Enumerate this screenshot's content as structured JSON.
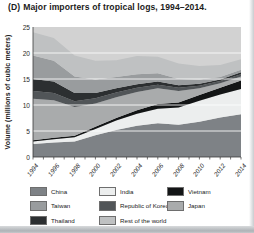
{
  "title": {
    "prefix": "(D)",
    "text": "Major importers of tropical logs, 1994–2014."
  },
  "chart_data": {
    "type": "area",
    "stacked": true,
    "xlabel": "",
    "ylabel": "Volume (millions of cubic meters)",
    "ylim": [
      0,
      25
    ],
    "yticks": [
      0,
      5,
      10,
      15,
      20,
      25
    ],
    "grid": true,
    "grid_color": "#ffffff",
    "plot_bg_color": "#d2d2d2",
    "axis_color": "#3a3a3a",
    "legend_position": "bottom",
    "x": [
      1994,
      1996,
      1998,
      2000,
      2002,
      2004,
      2006,
      2008,
      2010,
      2012,
      2014
    ],
    "x_tick_labels": [
      "1994",
      "1996",
      "1998",
      "2000",
      "2002",
      "2004",
      "2006",
      "2008",
      "2010",
      "2012",
      "2014"
    ],
    "series": [
      {
        "name": "China",
        "color": "#7e8286",
        "values": [
          2.5,
          2.8,
          3.0,
          4.2,
          5.2,
          6.0,
          6.5,
          6.2,
          6.8,
          7.6,
          8.2
        ]
      },
      {
        "name": "India",
        "color": "#eceeee",
        "values": [
          0.5,
          0.6,
          0.8,
          1.2,
          1.8,
          2.3,
          2.8,
          3.3,
          4.0,
          4.4,
          4.9
        ]
      },
      {
        "name": "Vietnam",
        "color": "#131516",
        "values": [
          0.2,
          0.3,
          0.3,
          0.4,
          0.5,
          0.7,
          0.9,
          1.0,
          1.1,
          1.3,
          1.6
        ]
      },
      {
        "name": "Japan",
        "color": "#a9abac",
        "values": [
          8.0,
          7.2,
          5.5,
          4.5,
          4.0,
          3.5,
          3.0,
          2.2,
          1.3,
          0.9,
          0.8
        ]
      },
      {
        "name": "Republic of Korea",
        "color": "#515558",
        "values": [
          1.5,
          1.4,
          1.1,
          1.0,
          0.9,
          0.8,
          0.7,
          0.6,
          0.5,
          0.4,
          0.4
        ]
      },
      {
        "name": "Thailand",
        "color": "#2c2f31",
        "values": [
          2.3,
          2.2,
          1.6,
          1.0,
          0.8,
          0.7,
          0.6,
          0.5,
          0.4,
          0.3,
          0.4
        ]
      },
      {
        "name": "Taiwan",
        "color": "#999c9e",
        "values": [
          4.5,
          4.0,
          3.2,
          2.6,
          2.2,
          1.9,
          1.6,
          1.2,
          0.8,
          0.5,
          0.5
        ]
      },
      {
        "name": "Rest of the world",
        "color": "#bfc1c2",
        "values": [
          4.5,
          4.4,
          4.0,
          3.6,
          3.2,
          3.5,
          3.2,
          3.0,
          2.6,
          2.3,
          2.0
        ]
      }
    ],
    "legend_columns": [
      [
        "China",
        "Taiwan",
        "Thailand"
      ],
      [
        "India",
        "Republic of Korea",
        "Rest of the world"
      ],
      [
        "Vietnam",
        "Japan"
      ]
    ]
  }
}
